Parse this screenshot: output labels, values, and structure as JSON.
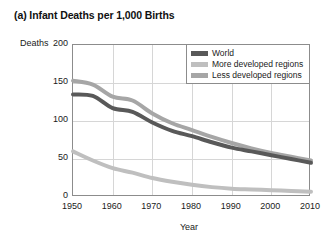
{
  "chart_data": {
    "type": "line",
    "title": "(a) Infant Deaths per 1,000 Births",
    "xlabel": "Year",
    "ylabel": "Deaths",
    "xlim": [
      1950,
      2010
    ],
    "ylim": [
      0,
      200
    ],
    "grid": true,
    "legend_position": "top-right",
    "xticks": [
      "1950",
      "1960",
      "1970",
      "1980",
      "1990",
      "2000",
      "2010"
    ],
    "yticks": [
      "200",
      "150",
      "100",
      "50",
      "0"
    ],
    "x": [
      1950,
      1955,
      1960,
      1965,
      1970,
      1975,
      1980,
      1985,
      1990,
      1995,
      2000,
      2005,
      2010
    ],
    "series": [
      {
        "name": "World",
        "color": "#595959",
        "values": [
          135,
          133,
          117,
          112,
          98,
          87,
          80,
          72,
          65,
          60,
          55,
          50,
          45
        ]
      },
      {
        "name": "More developed regions",
        "color": "#bfbfbf",
        "values": [
          60,
          48,
          38,
          32,
          25,
          20,
          16,
          13,
          11,
          10,
          9,
          8,
          7
        ]
      },
      {
        "name": "Less developed regions",
        "color": "#a6a6a6",
        "values": [
          153,
          148,
          132,
          127,
          110,
          97,
          88,
          79,
          71,
          64,
          58,
          53,
          48
        ]
      }
    ]
  },
  "legend": {
    "items": [
      {
        "label": "World"
      },
      {
        "label": "More developed regions"
      },
      {
        "label": "Less developed regions"
      }
    ]
  },
  "axes": {
    "y_title": "Deaths",
    "x_title": "Year"
  }
}
